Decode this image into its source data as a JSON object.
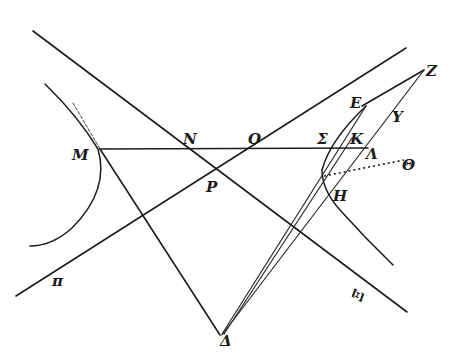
{
  "figure": {
    "width": 461,
    "height": 364,
    "ink_color": "#1c1c1c",
    "background": "#ffffff",
    "labels": {
      "M": "M",
      "N": "N",
      "O": "O",
      "P": "P",
      "Sigma": "Σ",
      "K": "K",
      "Lambda": "Λ",
      "E": "E",
      "Z": "Z",
      "Y": "Y",
      "Theta": "Θ",
      "H": "H",
      "Xi": "Ξ",
      "pi": "π",
      "Delta": "Δ"
    },
    "elements": {
      "asymptote_1": "line from upper-left through N and P to lower-right past Ξ",
      "asymptote_2": "line from lower-left (π) through P and O to upper-right",
      "chord_M_Lambda": "horizontal line M–N–O–Σ–K–Λ",
      "left_branch": "hyperbola branch tangent at M",
      "right_branch": "hyperbola branch through Σ and H",
      "line_M_Delta": "line from M to Δ",
      "lines_from_Delta": [
        "Δ–E",
        "Δ–K",
        "Δ–Z"
      ],
      "line_E_Z": "segment E–Z",
      "line_Z_Lambda": "line from Z through Y and Λ",
      "dotted_line": "dotted segment toward Θ"
    }
  }
}
